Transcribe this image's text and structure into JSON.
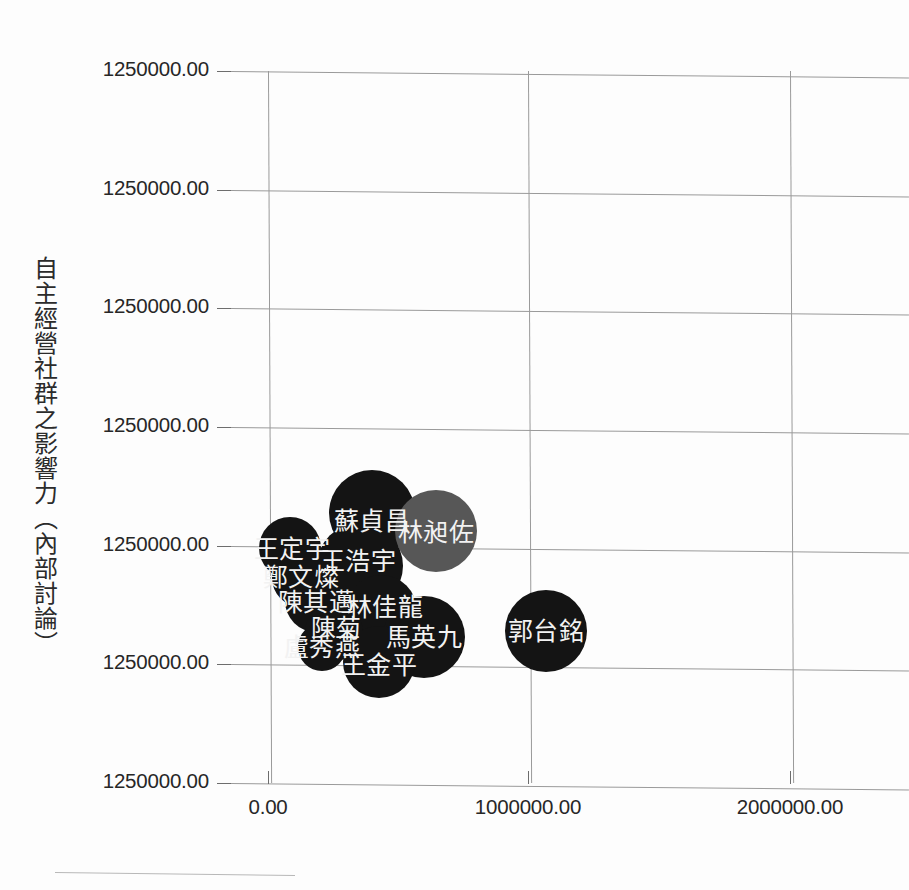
{
  "chart_data": {
    "type": "scatter",
    "title": "",
    "subtitle": "",
    "xlabel": "",
    "ylabel": "自主經營社群之影響力（內部討論）",
    "grid": true,
    "legend": "none",
    "xlim": [
      -1050000,
      2600000
    ],
    "ylim": [
      0,
      1250000
    ],
    "x_ticks": [
      {
        "label": "0.00",
        "value": 0,
        "px": 268
      },
      {
        "label": "1000000.00",
        "value": 1000000,
        "px": 528
      },
      {
        "label": "2000000.00",
        "value": 2000000,
        "px": 790
      }
    ],
    "y_ticks": [
      {
        "label": "1250000.00",
        "px": 71
      },
      {
        "label": "1250000.00",
        "px": 190
      },
      {
        "label": "1250000.00",
        "px": 308
      },
      {
        "label": "1250000.00",
        "px": 427
      },
      {
        "label": "1250000.00",
        "px": 546
      },
      {
        "label": "1250000.00",
        "px": 664
      },
      {
        "label": "1250000.00",
        "px": 783
      }
    ],
    "colors": {
      "bubble_dark": "#141414",
      "bubble_grey": "#575757",
      "label_text": "#f2f2f2",
      "gridline": "#9a9a9a",
      "axis_text": "#272727"
    },
    "points": [
      {
        "name": "蘇貞昌",
        "cx": 372,
        "cy": 513,
        "r": 43,
        "color": "#141414",
        "label_x": 372,
        "label_y": 521
      },
      {
        "name": "林昶佐",
        "cx": 436,
        "cy": 531,
        "r": 41,
        "color": "#575757",
        "label_x": 436,
        "label_y": 532
      },
      {
        "name": "王定宇",
        "cx": 290,
        "cy": 548,
        "r": 31,
        "color": "#141414",
        "label_x": 292,
        "label_y": 549
      },
      {
        "name": "王浩宇",
        "cx": 360,
        "cy": 566,
        "r": 43,
        "color": "#141414",
        "label_x": 358,
        "label_y": 561
      },
      {
        "name": "鄭文燦",
        "cx": 301,
        "cy": 578,
        "r": 29,
        "color": "#141414",
        "label_x": 301,
        "label_y": 577
      },
      {
        "name": "陳其邁",
        "cx": 316,
        "cy": 601,
        "r": 31,
        "color": "#141414",
        "label_x": 316,
        "label_y": 602
      },
      {
        "name": "林佳龍",
        "cx": 381,
        "cy": 611,
        "r": 36,
        "color": "#141414",
        "label_x": 385,
        "label_y": 607
      },
      {
        "name": "陳菊",
        "cx": 334,
        "cy": 632,
        "r": 29,
        "color": "#141414",
        "label_x": 336,
        "label_y": 628
      },
      {
        "name": "馬英九",
        "cx": 424,
        "cy": 637,
        "r": 41,
        "color": "#141414",
        "label_x": 424,
        "label_y": 637
      },
      {
        "name": "郭台銘",
        "cx": 546,
        "cy": 631,
        "r": 41,
        "color": "#141414",
        "label_x": 546,
        "label_y": 631
      },
      {
        "name": "盧秀燕",
        "cx": 322,
        "cy": 647,
        "r": 24,
        "color": "#141414",
        "label_x": 322,
        "label_y": 647
      },
      {
        "name": "王金平",
        "cx": 379,
        "cy": 662,
        "r": 36,
        "color": "#141414",
        "label_x": 379,
        "label_y": 665
      }
    ]
  }
}
